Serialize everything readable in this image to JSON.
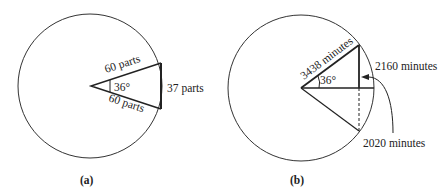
{
  "panels": [
    {
      "caption": "(a)",
      "angle_label": "36°",
      "side_top_label": "60 parts",
      "side_bottom_label": "60 parts",
      "chord_label": "37 parts"
    },
    {
      "caption": "(b)",
      "angle_label": "36°",
      "radius_label": "3438 minutes",
      "sine_label": "2160 minutes",
      "half_chord_label": "2020 minutes"
    }
  ],
  "colors": {
    "line": "#222222",
    "background": "#ffffff"
  }
}
